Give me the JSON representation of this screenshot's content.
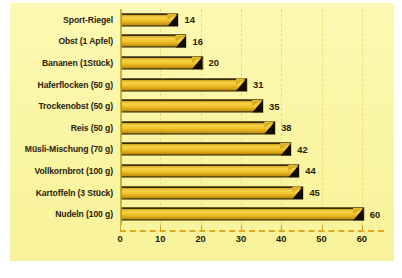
{
  "chart_data": {
    "type": "bar",
    "orientation": "horizontal",
    "title": "",
    "subtitle": "",
    "xlabel": "",
    "ylabel": "",
    "xlim": [
      0,
      65
    ],
    "xticks": [
      0,
      10,
      20,
      30,
      40,
      50,
      60
    ],
    "grid": "vertical-dashed",
    "legend": "none",
    "categories": [
      "Sport-Riegel",
      "Obst (1 Apfel)",
      "Bananen (1Stück)",
      "Haferflocken (50 g)",
      "Trockenobst (50 g)",
      "Reis (50 g)",
      "Müsli-Mischung (70 g)",
      "Vollkornbrot (100 g)",
      "Kartoffeln (3 Stück)",
      "Nudeln (100 g)"
    ],
    "values": [
      14,
      16,
      20,
      31,
      35,
      38,
      42,
      44,
      45,
      60
    ],
    "value_labels": [
      "14",
      "16",
      "20",
      "31",
      "35",
      "38",
      "42",
      "44",
      "45",
      "60"
    ],
    "tick_labels": [
      "0",
      "10",
      "20",
      "30",
      "40",
      "50",
      "60"
    ],
    "colors": {
      "background": "#fbf7a9",
      "bar_fill": "#f3c62c",
      "bar_highlight": "#f6d34a",
      "bar_edge": "#2e2404",
      "bar_cap": "#120d02",
      "gridline": "#e6d873",
      "axis": "#c9b43d",
      "baseline_dash": "#e0a81d",
      "text": "#241c08"
    }
  }
}
